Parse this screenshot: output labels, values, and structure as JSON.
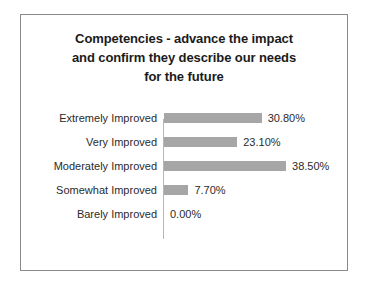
{
  "chart_data": {
    "type": "bar",
    "orientation": "horizontal",
    "title": "Competencies - advance the impact and confirm they describe our needs for the future",
    "title_lines": [
      "Competencies - advance the impact",
      "and confirm they describe our needs",
      "for the future"
    ],
    "categories": [
      "Extremely Improved",
      "Very Improved",
      "Moderately Improved",
      "Somewhat Improved",
      "Barely Improved"
    ],
    "values": [
      30.8,
      23.1,
      38.5,
      7.7,
      0.0
    ],
    "value_labels": [
      "30.80%",
      "23.10%",
      "38.50%",
      "7.70%",
      "0.00%"
    ],
    "xlabel": "",
    "ylabel": "",
    "xlim": [
      0,
      38.5
    ],
    "grid": false,
    "legend": false,
    "series": [
      {
        "name": "Percent of responses",
        "values": [
          30.8,
          23.1,
          38.5,
          7.7,
          0.0
        ]
      }
    ]
  },
  "style": {
    "bar_color": "#a6a6a6",
    "axis_color": "#b7b7b7",
    "border_color": "#8a8a8a",
    "text_color": "#2b2b2b",
    "title_color": "#1b1b1b",
    "background": "#ffffff"
  }
}
